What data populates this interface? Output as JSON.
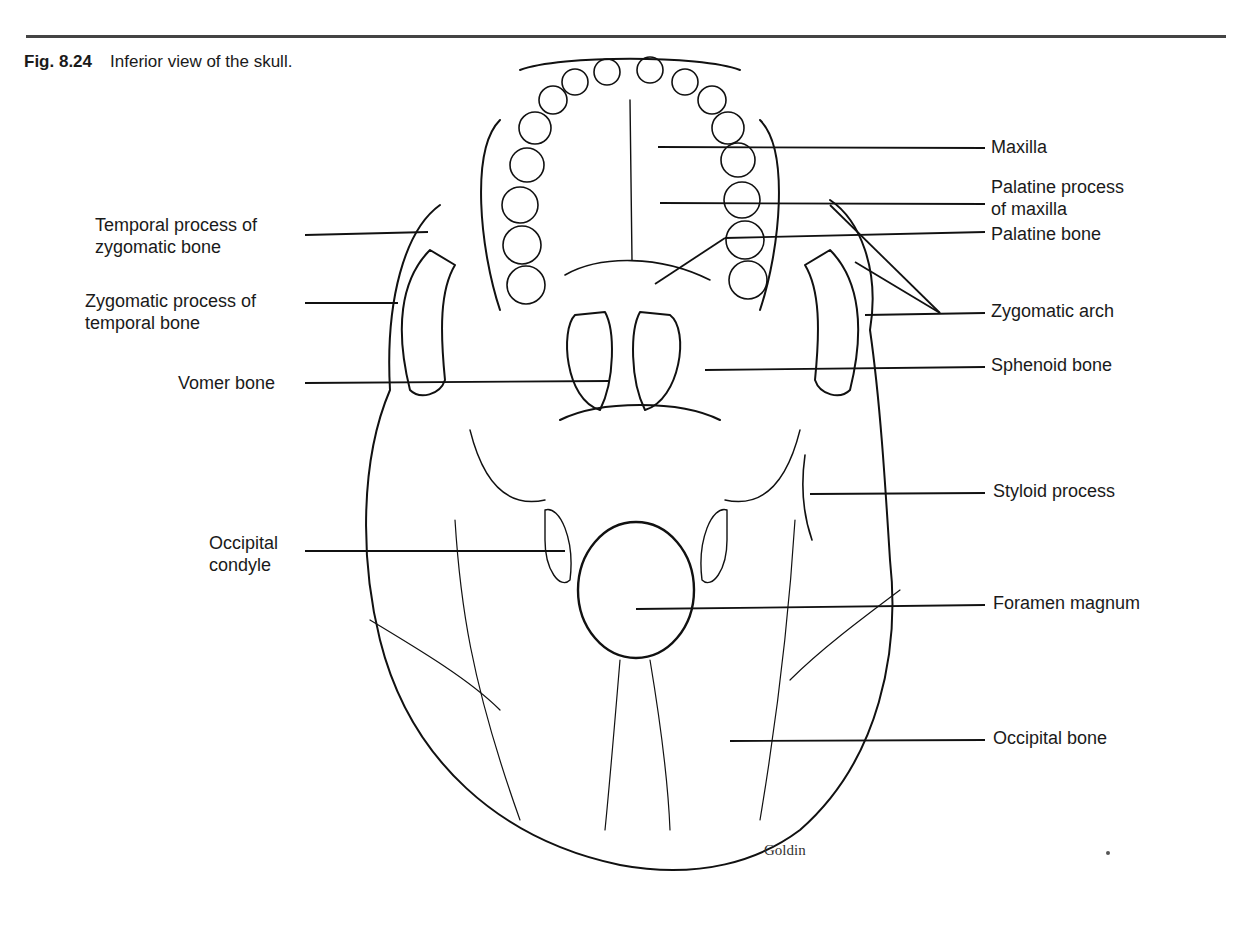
{
  "figure": {
    "number": "Fig. 8.24",
    "caption": "Inferior view of the skull.",
    "credit": "Goldin"
  },
  "labels_left": [
    {
      "line1": "Temporal process of",
      "line2": "zygomatic bone"
    },
    {
      "line1": "Zygomatic process of",
      "line2": "temporal bone"
    },
    {
      "line1": "Vomer bone",
      "line2": ""
    },
    {
      "line1": "Occipital",
      "line2": "condyle"
    }
  ],
  "labels_right": [
    {
      "line1": "Maxilla",
      "line2": ""
    },
    {
      "line1": "Palatine process",
      "line2": "of maxilla"
    },
    {
      "line1": "Palatine bone",
      "line2": ""
    },
    {
      "line1": "Zygomatic arch",
      "line2": ""
    },
    {
      "line1": "Sphenoid bone",
      "line2": ""
    },
    {
      "line1": "Styloid process",
      "line2": ""
    },
    {
      "line1": "Foramen magnum",
      "line2": ""
    },
    {
      "line1": "Occipital bone",
      "line2": ""
    }
  ]
}
